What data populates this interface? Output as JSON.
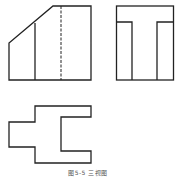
{
  "figure": {
    "caption": "图5-5 三视图",
    "stroke_color": "#222222",
    "views": [
      {
        "name": "front-view"
      },
      {
        "name": "side-view"
      },
      {
        "name": "top-view"
      }
    ]
  }
}
